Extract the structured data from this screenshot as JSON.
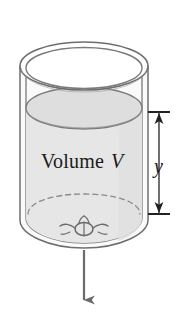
{
  "figure": {
    "labels": {
      "volume_word": "Volume",
      "volume_symbol": "V",
      "height_symbol": "y"
    },
    "colors": {
      "outline": "#6e6e6e",
      "outline_dark": "#4a4a4a",
      "liquid_fill": "#e3e3e3",
      "liquid_fill_top": "#dcdcdc",
      "wall_fill": "#f4f4f4",
      "background": "#ffffff",
      "text": "#1a1a1a",
      "arrow": "#6b6b6b",
      "dimension": "#2a2a2a",
      "dashed": "#8a8a8a"
    },
    "geometry": {
      "rim_outer_cx": 84,
      "rim_outer_cy": 66,
      "rim_outer_rx": 64,
      "rim_outer_ry": 24,
      "rim_inner_rx": 59,
      "rim_inner_ry": 21,
      "body_bottom_cy": 244,
      "liquid_surface_cy": 108,
      "liquid_surface_rx": 58,
      "liquid_surface_ry": 21,
      "hidden_bottom_cy": 214,
      "drain_cx": 84,
      "drain_cy": 229,
      "outflow_arrow_top": 252,
      "outflow_arrow_bottom": 303,
      "dimension_x": 158,
      "dimension_top": 112,
      "dimension_bottom": 214
    },
    "elements": [
      {
        "name": "tank-outer-wall",
        "desc": "outer cylinder wall outline"
      },
      {
        "name": "tank-inner-wall",
        "desc": "inner cylinder wall outline"
      },
      {
        "name": "tank-rim",
        "desc": "double ellipse open top rim"
      },
      {
        "name": "liquid-surface",
        "desc": "shaded ellipse top of liquid"
      },
      {
        "name": "liquid-body",
        "desc": "shaded liquid column"
      },
      {
        "name": "hidden-bottom-edge",
        "desc": "dashed ellipse hidden tank floor"
      },
      {
        "name": "drain-hole",
        "desc": "small hole at tank bottom center"
      },
      {
        "name": "outflow-arrow",
        "desc": "downward arrow showing water leaving"
      },
      {
        "name": "height-dimension",
        "desc": "double headed arrow measuring liquid depth"
      }
    ]
  }
}
